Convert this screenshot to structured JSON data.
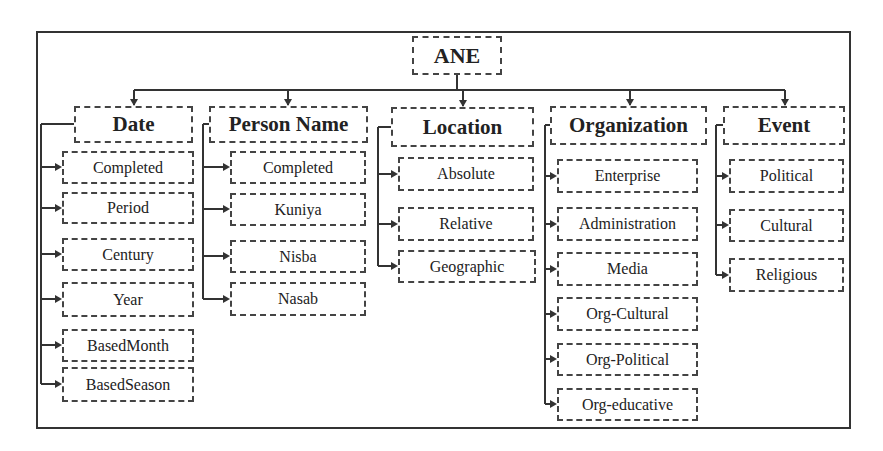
{
  "diagram": {
    "root": "ANE",
    "categories": [
      {
        "label": "Date",
        "children": [
          "Completed",
          "Period",
          "Century",
          "Year",
          "BasedMonth",
          "BasedSeason"
        ]
      },
      {
        "label": "Person Name",
        "children": [
          "Completed",
          "Kuniya",
          "Nisba",
          "Nasab"
        ]
      },
      {
        "label": "Location",
        "children": [
          "Absolute",
          "Relative",
          "Geographic"
        ]
      },
      {
        "label": "Organization",
        "children": [
          "Enterprise",
          "Administration",
          "Media",
          "Org-Cultural",
          "Org-Political",
          "Org-educative"
        ]
      },
      {
        "label": "Event",
        "children": [
          "Political",
          "Cultural",
          "Religious"
        ]
      }
    ]
  },
  "colors": {
    "line": "#333333",
    "box_border": "#444444",
    "background": "#ffffff"
  }
}
